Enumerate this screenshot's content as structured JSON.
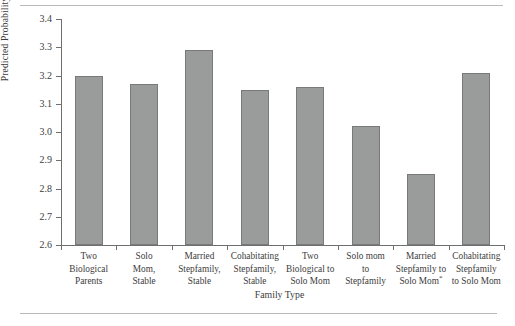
{
  "chart_data": {
    "type": "bar",
    "title": "",
    "xlabel": "Family Type",
    "ylabel": "Predicted Probability",
    "ylim": [
      2.6,
      3.4
    ],
    "yticks": [
      "2.6",
      "2.7",
      "2.8",
      "2.9",
      "3.0",
      "3.1",
      "3.2",
      "3.3",
      "3.4"
    ],
    "grid": false,
    "legend": null,
    "categories": [
      "Two Biological Parents",
      "Solo Mom, Stable",
      "Married Stepfamily, Stable",
      "Cohabitating Stepfamily, Stable",
      "Two Biological to Solo Mom",
      "Solo mom to Stepfamily",
      "Married Stepfamily to Solo Mom*",
      "Cohabitating Stepfamily to Solo Mom"
    ],
    "category_lines": [
      [
        "Two",
        "Biological",
        "Parents"
      ],
      [
        "Solo",
        "Mom,",
        "Stable"
      ],
      [
        "Married",
        "Stepfamily,",
        "Stable"
      ],
      [
        "Cohabitating",
        "Stepfamily,",
        "Stable"
      ],
      [
        "Two",
        "Biological to",
        "Solo Mom"
      ],
      [
        "Solo mom",
        "to",
        "Stepfamily"
      ],
      [
        "Married",
        "Stepfamily to",
        "Solo Mom*"
      ],
      [
        "Cohabitating",
        "Stepfamily",
        "to Solo Mom"
      ]
    ],
    "values": [
      3.2,
      3.17,
      3.29,
      3.15,
      3.16,
      3.02,
      2.85,
      3.21
    ],
    "bar_color": "#9a9b9b",
    "bar_border_color": "#77797a",
    "axis_color": "#6f6f6f"
  }
}
